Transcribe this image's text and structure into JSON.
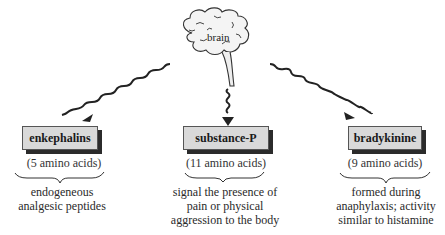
{
  "diagram": {
    "center": {
      "label": "brain",
      "icon": "brain-icon"
    },
    "nodes": [
      {
        "name": "enkephalins",
        "size": "(5 amino acids)",
        "description_lines": [
          "endogeneous",
          "analgesic peptides"
        ]
      },
      {
        "name": "substance-P",
        "size": "(11 amino acids)",
        "description_lines": [
          "signal the presence of",
          "pain or physical",
          "aggression to the body"
        ]
      },
      {
        "name": "bradykinine",
        "size": "(9 amino acids)",
        "description_lines": [
          "formed during",
          "anaphylaxis; activity",
          "similar to histamine"
        ]
      }
    ],
    "edges": [
      {
        "from": "brain",
        "to": "enkephalins",
        "style": "wavy-arrow"
      },
      {
        "from": "brain",
        "to": "substance-P",
        "style": "wavy-arrow"
      },
      {
        "from": "brain",
        "to": "bradykinine",
        "style": "wavy-arrow"
      }
    ]
  }
}
